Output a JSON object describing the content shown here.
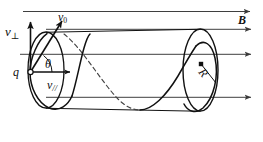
{
  "figure": {
    "labels": {
      "v_perp": "v",
      "v_perp_sub": "⊥",
      "v_zero": "v",
      "v_zero_sub": "0",
      "charge": "q",
      "theta": "θ",
      "v_parallel": "v",
      "v_parallel_sub": "//",
      "magnetic_field": "B",
      "radius": "R"
    },
    "colors": {
      "stroke": "#111111",
      "field_line": "#4a4a4a",
      "background": "#ffffff",
      "dashed_path": "#555555"
    },
    "icons": {
      "charge_marker": "open-circle-marker",
      "center_marker": "filled-dot-marker",
      "field_arrow": "arrowhead-right",
      "v_perp_arrow": "arrowhead-up",
      "v_zero_arrow": "arrowhead-up-right",
      "v_par_arrow": "arrowhead-right"
    },
    "geometry": {
      "left_ellipse": {
        "cx": 46,
        "cy": 70,
        "rx": 18,
        "ry": 38
      },
      "right_ellipse": {
        "cx": 200.5,
        "cy": 70,
        "rx": 17.5,
        "ry": 41
      },
      "field_lines_y": [
        11,
        29,
        54,
        97
      ],
      "cylinder_top_y": 29,
      "cylinder_bottom_y": 111,
      "center_dot": {
        "cx": 201,
        "cy": 64
      },
      "charge_point": {
        "cx": 30,
        "cy": 72
      }
    }
  }
}
